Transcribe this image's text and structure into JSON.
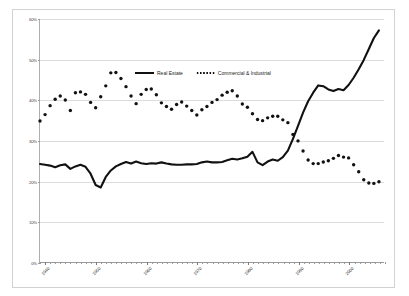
{
  "chart_data": {
    "type": "line",
    "title": "",
    "xlabel": "",
    "ylabel": "",
    "xlim": [
      1939,
      2007
    ],
    "ylim": [
      0,
      60
    ],
    "grid": true,
    "legend_position": "upper-center",
    "y_ticks": [
      "0%",
      "10%",
      "20%",
      "30%",
      "40%",
      "50%",
      "60%"
    ],
    "y_tick_values": [
      0,
      10,
      20,
      30,
      40,
      50,
      60
    ],
    "x_ticks": [
      "1940",
      "1950",
      "1960",
      "1970",
      "1980",
      "1990",
      "2000"
    ],
    "x_tick_values": [
      1940,
      1950,
      1960,
      1970,
      1980,
      1990,
      2000
    ],
    "series": [
      {
        "name": "Real Estate",
        "style": "solid",
        "color": "#111111",
        "x": [
          1939,
          1940,
          1941,
          1942,
          1943,
          1944,
          1945,
          1946,
          1947,
          1948,
          1949,
          1950,
          1951,
          1952,
          1953,
          1954,
          1955,
          1956,
          1957,
          1958,
          1959,
          1960,
          1961,
          1962,
          1963,
          1964,
          1965,
          1966,
          1967,
          1968,
          1969,
          1970,
          1971,
          1972,
          1973,
          1974,
          1975,
          1976,
          1977,
          1978,
          1979,
          1980,
          1981,
          1982,
          1983,
          1984,
          1985,
          1986,
          1987,
          1988,
          1989,
          1990,
          1991,
          1992,
          1993,
          1994,
          1995,
          1996,
          1997,
          1998,
          1999,
          2000,
          2001,
          2002,
          2003,
          2004,
          2005,
          2006
        ],
        "values": [
          24.2,
          24.0,
          23.8,
          23.4,
          23.9,
          24.1,
          23.0,
          23.6,
          24.0,
          23.5,
          21.8,
          19.0,
          18.4,
          21.0,
          22.6,
          23.6,
          24.2,
          24.7,
          24.3,
          24.8,
          24.4,
          24.2,
          24.4,
          24.3,
          24.6,
          24.3,
          24.1,
          24.0,
          24.0,
          24.1,
          24.1,
          24.2,
          24.6,
          24.8,
          24.6,
          24.6,
          24.7,
          25.1,
          25.5,
          25.3,
          25.6,
          26.0,
          27.2,
          24.6,
          23.9,
          24.8,
          25.3,
          25.0,
          25.9,
          27.5,
          30.4,
          33.6,
          36.9,
          39.7,
          41.8,
          43.6,
          43.4,
          42.6,
          42.2,
          42.7,
          42.4,
          43.7,
          45.5,
          47.6,
          49.9,
          52.6,
          55.3,
          57.2
        ]
      },
      {
        "name": "Commercial & Industrial",
        "style": "dotted",
        "color": "#111111",
        "x": [
          1939,
          1940,
          1941,
          1942,
          1943,
          1944,
          1945,
          1946,
          1947,
          1948,
          1949,
          1950,
          1951,
          1952,
          1953,
          1954,
          1955,
          1956,
          1957,
          1958,
          1959,
          1960,
          1961,
          1962,
          1963,
          1964,
          1965,
          1966,
          1967,
          1968,
          1969,
          1970,
          1971,
          1972,
          1973,
          1974,
          1975,
          1976,
          1977,
          1978,
          1979,
          1980,
          1981,
          1982,
          1983,
          1984,
          1985,
          1986,
          1987,
          1988,
          1989,
          1990,
          1991,
          1992,
          1993,
          1994,
          1995,
          1996,
          1997,
          1998,
          1999,
          2000,
          2001,
          2002,
          2003,
          2004,
          2005,
          2006
        ],
        "values": [
          34.8,
          36.4,
          38.6,
          40.2,
          41.0,
          40.0,
          37.4,
          41.8,
          42.0,
          41.4,
          39.4,
          38.1,
          40.8,
          43.5,
          46.7,
          46.8,
          45.3,
          43.3,
          41.0,
          39.1,
          41.4,
          42.6,
          42.7,
          41.3,
          39.3,
          38.4,
          37.7,
          38.9,
          39.5,
          38.5,
          37.4,
          36.3,
          37.6,
          38.4,
          39.4,
          40.1,
          41.2,
          41.9,
          42.3,
          41.0,
          39.0,
          38.2,
          36.6,
          35.2,
          34.9,
          35.6,
          36.0,
          36.0,
          35.1,
          34.4,
          31.5,
          29.9,
          27.4,
          25.2,
          24.3,
          24.3,
          24.7,
          25.0,
          25.6,
          26.3,
          25.9,
          25.7,
          24.0,
          22.3,
          20.3,
          19.5,
          19.4,
          19.8
        ]
      }
    ]
  },
  "legend": {
    "real_estate": "Real Estate",
    "commercial": "Commercial & Industrial"
  }
}
